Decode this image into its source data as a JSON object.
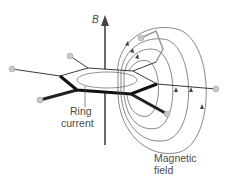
{
  "diagram": {
    "labels": {
      "field_axis": "B",
      "ring_current_line1": "Ring",
      "ring_current_line2": "current",
      "magnetic_field_line1": "Magnetic",
      "magnetic_field_line2": "field"
    },
    "colors": {
      "line": "#2b2b2b",
      "bond_bold": "#111111",
      "atom": "#c8c8c8",
      "text": "#4a4a4a"
    }
  }
}
